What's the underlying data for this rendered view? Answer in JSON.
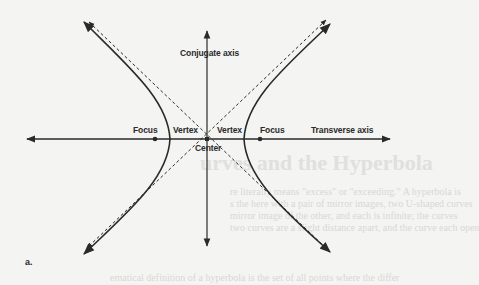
{
  "figure": {
    "panel_label": "a.",
    "labels": {
      "conjugate_axis": "Conjugate axis",
      "transverse_axis": "Transverse axis",
      "focus_left": "Focus",
      "focus_right": "Focus",
      "vertex_left": "Vertex",
      "vertex_right": "Vertex",
      "center": "Center"
    },
    "colors": {
      "line": "#2a2a2a",
      "background": "#f4f4f2"
    }
  },
  "background_bleed": {
    "title": "urves and the Hyperbola",
    "lines": [
      "re literally means \"excess\" or \"exceeding.\" A hyperbola is",
      "s the here with a pair of mirror images, two U-shaped curves",
      "mirror image of the other, and each is infinite; the curves",
      "two curves are a slight distance apart, and the curve each open",
      "ematical definition of a hyperbola is the set of all points where the differ"
    ]
  }
}
